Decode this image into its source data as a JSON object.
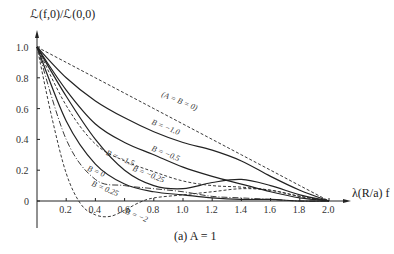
{
  "chart_data": {
    "type": "line",
    "title": "",
    "caption": "(a)  A = 1",
    "ylabel": "ℒ(f,0)/ℒ(0,0)",
    "xlabel": "λ(R/a) f",
    "xlim": [
      0,
      2.0
    ],
    "ylim": [
      -0.1,
      1.0
    ],
    "grid": false,
    "legend": "inline labels",
    "x_ticks": [
      "0.2",
      "0.4",
      "0.6",
      "0.8",
      "1.0",
      "1.2",
      "1.4",
      "1.6",
      "1.8",
      "2.0"
    ],
    "y_ticks": [
      "0",
      "0.2",
      "0.4",
      "0.6",
      "0.8",
      "1.0"
    ],
    "series": [
      {
        "name": "(A = B = 0)",
        "style": "dashed",
        "x": [
          0,
          0.2,
          0.4,
          0.6,
          0.8,
          1.0,
          1.2,
          1.4,
          1.6,
          1.8,
          2.0
        ],
        "y": [
          1.0,
          0.9,
          0.8,
          0.7,
          0.6,
          0.5,
          0.4,
          0.3,
          0.2,
          0.1,
          0.0
        ]
      },
      {
        "name": "B = -1.0",
        "style": "solid",
        "x": [
          0,
          0.2,
          0.4,
          0.6,
          0.8,
          1.0,
          1.2,
          1.4,
          1.6,
          1.8,
          2.0
        ],
        "y": [
          1.0,
          0.8,
          0.65,
          0.54,
          0.45,
          0.38,
          0.33,
          0.26,
          0.16,
          0.07,
          0.0
        ]
      },
      {
        "name": "B = -0.5",
        "style": "solid",
        "x": [
          0,
          0.2,
          0.4,
          0.6,
          0.8,
          1.0,
          1.2,
          1.4,
          1.6,
          1.8,
          2.0
        ],
        "y": [
          1.0,
          0.72,
          0.5,
          0.38,
          0.3,
          0.22,
          0.16,
          0.11,
          0.06,
          0.02,
          0.0
        ]
      },
      {
        "name": "B = -0.25",
        "style": "dashed",
        "x": [
          0,
          0.2,
          0.4,
          0.6,
          0.8,
          1.0,
          1.2,
          1.4,
          1.6,
          1.8,
          2.0
        ],
        "y": [
          1.0,
          0.62,
          0.37,
          0.26,
          0.19,
          0.13,
          0.1,
          0.09,
          0.07,
          0.03,
          0.0
        ]
      },
      {
        "name": "B = -1.5",
        "style": "solid",
        "x": [
          0,
          0.2,
          0.4,
          0.6,
          0.8,
          1.0,
          1.2,
          1.4,
          1.6,
          1.8,
          2.0
        ],
        "y": [
          1.0,
          0.68,
          0.4,
          0.2,
          0.1,
          0.08,
          0.12,
          0.14,
          0.1,
          0.04,
          0.0
        ]
      },
      {
        "name": "B = 0",
        "style": "solid",
        "x": [
          0,
          0.2,
          0.4,
          0.6,
          0.8,
          1.0,
          1.2,
          1.4,
          1.6,
          1.8,
          2.0
        ],
        "y": [
          1.0,
          0.52,
          0.24,
          0.11,
          0.06,
          0.04,
          0.02,
          0.01,
          0.01,
          0.0,
          0.0
        ]
      },
      {
        "name": "B = 0.25",
        "style": "dash-dot",
        "x": [
          0,
          0.2,
          0.4,
          0.6,
          0.8,
          1.0,
          1.2,
          1.4,
          1.6,
          1.8,
          2.0
        ],
        "y": [
          1.0,
          0.4,
          0.14,
          0.1,
          0.08,
          0.06,
          0.03,
          0.02,
          0.01,
          0.0,
          0.0
        ]
      },
      {
        "name": "B = -2",
        "style": "dashed",
        "x": [
          0,
          0.1,
          0.2,
          0.3,
          0.4,
          0.5,
          0.6,
          0.7,
          0.8,
          1.0,
          1.2,
          1.4,
          1.6,
          1.8,
          2.0
        ],
        "y": [
          1.0,
          0.55,
          0.18,
          -0.02,
          -0.09,
          -0.1,
          -0.06,
          -0.01,
          0.02,
          0.04,
          0.06,
          0.08,
          0.07,
          0.03,
          0.0
        ]
      }
    ],
    "annotations": [
      {
        "text": "(A = B = 0)",
        "x": 0.85,
        "y": 0.68
      },
      {
        "text": "B = −1.0",
        "x": 0.78,
        "y": 0.5
      },
      {
        "text": "B = −0.5",
        "x": 0.78,
        "y": 0.33
      },
      {
        "text": "B = −1.5",
        "x": 0.47,
        "y": 0.3
      },
      {
        "text": "B = −0.25",
        "x": 0.65,
        "y": 0.2
      },
      {
        "text": "B = 0",
        "x": 0.34,
        "y": 0.2
      },
      {
        "text": "B = 0.25",
        "x": 0.37,
        "y": 0.1
      },
      {
        "text": "B = −2",
        "x": 0.6,
        "y": -0.08
      }
    ]
  }
}
